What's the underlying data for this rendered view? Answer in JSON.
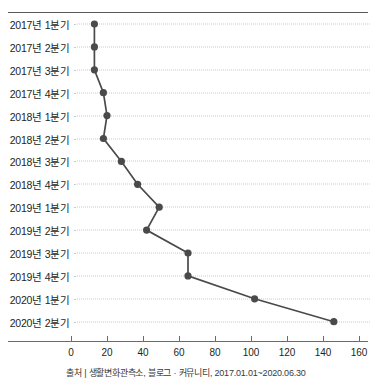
{
  "chart_data": {
    "type": "line",
    "orientation": "horizontal",
    "title": "",
    "xlabel": "",
    "ylabel": "",
    "categories": [
      "2017년 1분기",
      "2017년 2분기",
      "2017년 3분기",
      "2017년 4분기",
      "2018년 1분기",
      "2018년 2분기",
      "2018년 3분기",
      "2018년 4분기",
      "2019년 1분기",
      "2019년 2분기",
      "2019년 3분기",
      "2019년 4분기",
      "2020년 1분기",
      "2020년 2분기"
    ],
    "values": [
      13,
      13,
      13,
      18,
      20,
      18,
      28,
      37,
      49,
      42,
      65,
      65,
      102,
      146
    ],
    "xlim": [
      -4,
      172
    ],
    "xticks": [
      0,
      20,
      40,
      60,
      80,
      100,
      120,
      140,
      160
    ],
    "xticklabels": [
      "0",
      "20",
      "40",
      "60",
      "80",
      "100",
      "120",
      "140",
      "160"
    ],
    "grid": "horizontal-dotted",
    "legend": "none",
    "line_color": "#4a4a4a",
    "marker_color": "#4a4a4a",
    "grid_color": "#c9c9c9",
    "axis_color": "#6b6b6b"
  },
  "caption": "출처 | 생활변화관측소, 블로그 · 커뮤니티, 2017.01.01~2020.06.30"
}
